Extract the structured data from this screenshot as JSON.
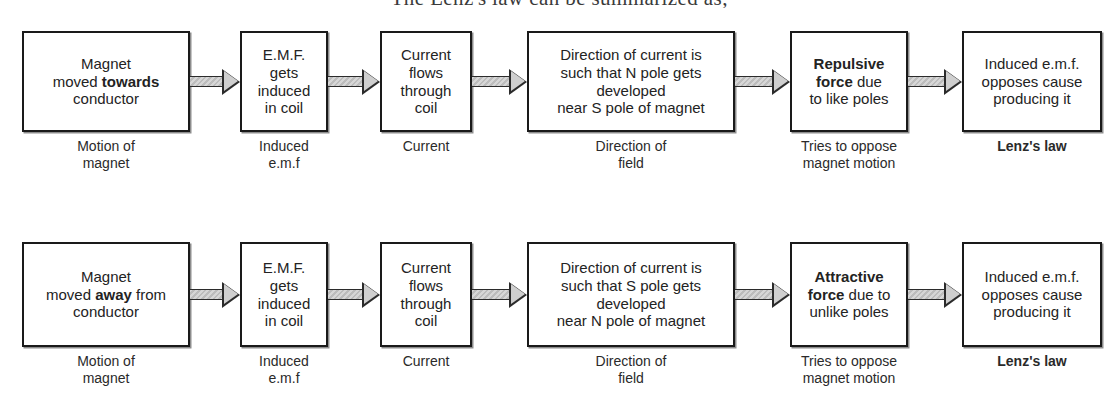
{
  "heading": "The Lenz's law can be summarized as;",
  "colors": {
    "box_border": "#1a1a1a",
    "box_fill": "#ffffff",
    "arrow_fill": "#c9c9c9",
    "arrow_outline": "#2b2b2b",
    "text": "#232323",
    "page_background": "#ffffff"
  },
  "diagram": {
    "type": "flowchart",
    "rows": [
      {
        "id": "row-towards",
        "steps": [
          {
            "box_lines": [
              "Magnet",
              "moved <b>towards</b>",
              "conductor"
            ],
            "box_text": "Magnet moved towards conductor",
            "emphasis": "towards",
            "caption": "Motion of\nmagnet",
            "caption_bold": false
          },
          {
            "box_lines": [
              "E.M.F.",
              "gets",
              "induced",
              "in coil"
            ],
            "box_text": "E.M.F. gets induced in coil",
            "emphasis": "",
            "caption": "Induced\ne.m.f",
            "caption_bold": false
          },
          {
            "box_lines": [
              "Current",
              "flows",
              "through",
              "coil"
            ],
            "box_text": "Current flows through coil",
            "emphasis": "",
            "caption": "Current",
            "caption_bold": false
          },
          {
            "box_lines": [
              "Direction of current is",
              "such that N pole gets",
              "developed",
              "near S pole of magnet"
            ],
            "box_text": "Direction of current is such that N pole gets developed near S pole of magnet",
            "emphasis": "",
            "caption": "Direction of\nfield",
            "caption_bold": false
          },
          {
            "box_lines": [
              "<b>Repulsive</b>",
              "<b>force</b> due",
              "to like poles"
            ],
            "box_text": "Repulsive force due to like poles",
            "emphasis": "Repulsive force",
            "caption": "Tries to oppose\nmagnet motion",
            "caption_bold": false
          },
          {
            "box_lines": [
              "Induced e.m.f.",
              "opposes cause",
              "producing it"
            ],
            "box_text": "Induced e.m.f. opposes cause producing it",
            "emphasis": "",
            "caption": "Lenz's law",
            "caption_bold": true
          }
        ]
      },
      {
        "id": "row-away",
        "steps": [
          {
            "box_lines": [
              "Magnet",
              "moved <b>away</b> from",
              "conductor"
            ],
            "box_text": "Magnet moved away from conductor",
            "emphasis": "away",
            "caption": "Motion of\nmagnet",
            "caption_bold": false
          },
          {
            "box_lines": [
              "E.M.F.",
              "gets",
              "induced",
              "in coil"
            ],
            "box_text": "E.M.F. gets induced in coil",
            "emphasis": "",
            "caption": "Induced\ne.m.f",
            "caption_bold": false
          },
          {
            "box_lines": [
              "Current",
              "flows",
              "through",
              "coil"
            ],
            "box_text": "Current flows through coil",
            "emphasis": "",
            "caption": "Current",
            "caption_bold": false
          },
          {
            "box_lines": [
              "Direction of current is",
              "such that S pole gets",
              "developed",
              "near N pole of magnet"
            ],
            "box_text": "Direction of current is such that S pole gets developed near N pole of magnet",
            "emphasis": "",
            "caption": "Direction of\nfield",
            "caption_bold": false
          },
          {
            "box_lines": [
              "<b>Attractive</b>",
              "<b>force</b> due to",
              "unlike poles"
            ],
            "box_text": "Attractive force due to unlike poles",
            "emphasis": "Attractive force",
            "caption": "Tries to oppose\nmagnet motion",
            "caption_bold": false
          },
          {
            "box_lines": [
              "Induced e.m.f.",
              "opposes cause",
              "producing it"
            ],
            "box_text": "Induced e.m.f. opposes cause producing it",
            "emphasis": "",
            "caption": "Lenz's law",
            "caption_bold": true
          }
        ]
      }
    ]
  },
  "layout": {
    "rows": [
      {
        "box_top": 31,
        "box_height": 101,
        "caption_top": 138
      },
      {
        "box_top": 242,
        "box_height": 105,
        "caption_top": 353
      }
    ],
    "boxes": [
      {
        "left": 22,
        "width": 168,
        "font": 15
      },
      {
        "left": 240,
        "width": 88,
        "font": 15
      },
      {
        "left": 380,
        "width": 92,
        "font": 15
      },
      {
        "left": 527,
        "width": 208,
        "font": 15
      },
      {
        "left": 790,
        "width": 118,
        "font": 15
      },
      {
        "left": 962,
        "width": 140,
        "font": 15
      }
    ],
    "arrows": [
      {
        "left": 190,
        "width": 50
      },
      {
        "left": 328,
        "width": 52
      },
      {
        "left": 472,
        "width": 55
      },
      {
        "left": 735,
        "width": 55
      },
      {
        "left": 908,
        "width": 54
      }
    ],
    "caption_font": 14
  }
}
